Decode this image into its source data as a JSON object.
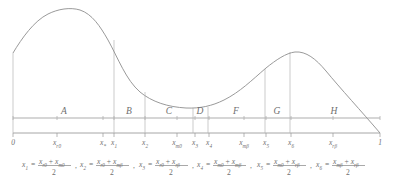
{
  "figure": {
    "name": "piecewise-region-density-diagram",
    "axis": {
      "start_label": "0",
      "end_label": "1",
      "x_min": 0,
      "x_max": 1
    },
    "regions": [
      {
        "id": "A",
        "label": "A",
        "center_px": 64
      },
      {
        "id": "B",
        "label": "B",
        "center_px": 129
      },
      {
        "id": "C",
        "label": "C",
        "center_px": 169
      },
      {
        "id": "D",
        "label": "D",
        "center_px": 200
      },
      {
        "id": "F",
        "label": "F",
        "center_px": 236
      },
      {
        "id": "G",
        "label": "G",
        "center_px": 277
      },
      {
        "id": "H",
        "label": "H",
        "center_px": 334
      }
    ],
    "ticks": [
      {
        "id": "zero",
        "base": "0",
        "sub": "",
        "x_px": 13,
        "style": "plain"
      },
      {
        "id": "xr0",
        "base": "x",
        "sub": "r0",
        "x_px": 57,
        "style": "italic"
      },
      {
        "id": "xstar",
        "base": "x",
        "sub": "*",
        "x_px": 103,
        "style": "italic"
      },
      {
        "id": "x1",
        "base": "x",
        "sub": "1",
        "x_px": 114,
        "style": "italic"
      },
      {
        "id": "x2",
        "base": "x",
        "sub": "2",
        "x_px": 145,
        "style": "italic"
      },
      {
        "id": "xm0",
        "base": "x",
        "sub": "m0",
        "x_px": 177,
        "style": "italic"
      },
      {
        "id": "x3",
        "base": "x",
        "sub": "3",
        "x_px": 195,
        "style": "italic"
      },
      {
        "id": "x4",
        "base": "x",
        "sub": "4",
        "x_px": 209,
        "style": "italic"
      },
      {
        "id": "xmb",
        "base": "x",
        "sub": "mβ",
        "x_px": 244,
        "style": "italic"
      },
      {
        "id": "x5",
        "base": "x",
        "sub": "5",
        "x_px": 266,
        "style": "italic"
      },
      {
        "id": "x6",
        "base": "x",
        "sub": "6",
        "x_px": 291,
        "style": "italic"
      },
      {
        "id": "xrb",
        "base": "x",
        "sub": "rβ",
        "x_px": 333,
        "style": "italic"
      },
      {
        "id": "one",
        "base": "1",
        "sub": "",
        "x_px": 380,
        "style": "plain"
      }
    ],
    "vertical_lines_px": [
      13,
      114,
      145,
      193,
      208,
      265,
      290
    ],
    "curve_path": "M 13,53 C 22,38 34,21 48,14 C 58,9 70,7 80,10 C 92,14 100,26 108,40 C 118,58 126,80 140,92 C 152,102 168,107 186,108 C 200,108.6 212,106 224,100 C 240,92 252,80 266,68 C 276,60 286,53 295,52 C 306,51 316,59 326,71 C 340,88 362,112 380,133",
    "baseline": {
      "x_start": 13,
      "x_end": 380,
      "y": 133
    },
    "midline": {
      "x_start": 13,
      "x_end": 380,
      "y": 118
    }
  },
  "equations": [
    {
      "id": "x1",
      "lhs": "x",
      "lhs_sub": "1",
      "num_a": "x",
      "num_a_sub": "r0",
      "num_b": "x",
      "num_b_sub": "m0",
      "den": "2",
      "x_px": 22
    },
    {
      "id": "x2",
      "lhs": "x",
      "lhs_sub": "2",
      "num_a": "x",
      "num_a_sub": "r0",
      "num_b": "x",
      "num_b_sub": "mβ",
      "den": "2",
      "x_px": 80
    },
    {
      "id": "x3",
      "lhs": "x",
      "lhs_sub": "3",
      "num_a": "x",
      "num_a_sub": "r0",
      "num_b": "x",
      "num_b_sub": "rβ",
      "den": "2",
      "x_px": 139
    },
    {
      "id": "x4",
      "lhs": "x",
      "lhs_sub": "4",
      "num_a": "x",
      "num_a_sub": "m0",
      "num_b": "x",
      "num_b_sub": "mβ",
      "den": "2",
      "x_px": 197
    },
    {
      "id": "x5",
      "lhs": "x",
      "lhs_sub": "5",
      "num_a": "x",
      "num_a_sub": "m0",
      "num_b": "x",
      "num_b_sub": "rβ",
      "den": "2",
      "x_px": 257
    },
    {
      "id": "x6",
      "lhs": "x",
      "lhs_sub": "6",
      "num_a": "x",
      "num_a_sub": "mβ",
      "num_b": "x",
      "num_b_sub": "rβ",
      "den": "2",
      "x_px": 316
    }
  ],
  "separators": [
    ", ",
    ", ",
    ", ",
    ", ",
    ", "
  ],
  "symbols": {
    "equals": "=",
    "plus": "+",
    "comma": ","
  },
  "colors": {
    "curve": "#9a9a9a",
    "axis": "#8f8f8f",
    "vline": "#b4b4b4",
    "midline": "#c9c9c9",
    "text": "#6f6f6f",
    "background": "#ffffff"
  },
  "chart_data": {
    "type": "line",
    "title": "",
    "xlabel": "",
    "ylabel": "",
    "xlim": [
      0,
      1
    ],
    "grid": false,
    "legend": null,
    "breakpoints": [
      "0",
      "x_r0",
      "x*",
      "x_1",
      "x_2",
      "x_m0",
      "x_3",
      "x_4",
      "x_mβ",
      "x_5",
      "x_6",
      "x_rβ",
      "1"
    ],
    "region_boundaries": [
      {
        "region": "A",
        "from": "0",
        "to": "x_1"
      },
      {
        "region": "B",
        "from": "x_1",
        "to": "x_2"
      },
      {
        "region": "C",
        "from": "x_2",
        "to": "x_3"
      },
      {
        "region": "D",
        "from": "x_3",
        "to": "x_4"
      },
      {
        "region": "F",
        "from": "x_4",
        "to": "x_5"
      },
      {
        "region": "G",
        "from": "x_5",
        "to": "x_6"
      },
      {
        "region": "H",
        "from": "x_6",
        "to": "1"
      }
    ],
    "x": [
      0.0,
      0.04,
      0.1,
      0.18,
      0.26,
      0.34,
      0.42,
      0.5,
      0.58,
      0.66,
      0.74,
      0.8,
      0.86,
      0.92,
      1.0
    ],
    "y": [
      0.62,
      0.78,
      0.92,
      0.99,
      0.94,
      0.78,
      0.52,
      0.31,
      0.22,
      0.21,
      0.32,
      0.52,
      0.63,
      0.55,
      0.0
    ]
  }
}
